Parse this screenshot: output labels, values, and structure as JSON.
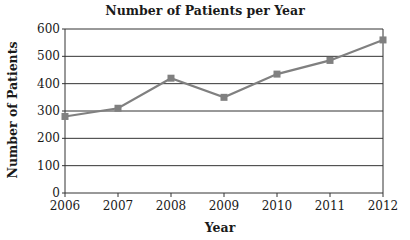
{
  "chart_data": {
    "type": "line",
    "title": "Number of Patients per Year",
    "xlabel": "Year",
    "ylabel": "Number of Patients",
    "categories": [
      "2006",
      "2007",
      "2008",
      "2009",
      "2010",
      "2011",
      "2012"
    ],
    "series": [
      {
        "name": "Number of Patients",
        "values": [
          280,
          310,
          420,
          350,
          435,
          485,
          560
        ]
      }
    ],
    "ylim": [
      0,
      600
    ],
    "yticks": [
      0,
      100,
      200,
      300,
      400,
      500,
      600
    ],
    "grid": {
      "horizontal": true,
      "vertical": false
    },
    "legend": null,
    "marker": "square",
    "colors": {
      "line": "#808080",
      "marker": "#808080",
      "grid": "#333333",
      "axis": "#333333"
    }
  }
}
